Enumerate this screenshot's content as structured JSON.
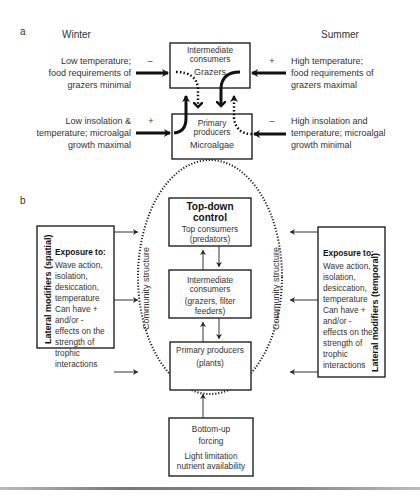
{
  "panel_a": {
    "label": "a",
    "winter": {
      "title": "Winter",
      "top_text": [
        "Low temperature;",
        "food requirements of",
        "grazers minimal"
      ],
      "top_sign": "–",
      "bottom_text": [
        "Low insolation &",
        "temperature; microalgal",
        "growth maximal"
      ],
      "bottom_sign": "+"
    },
    "summer": {
      "title": "Summer",
      "top_text": [
        "High temperature;",
        "food requirements of",
        "grazers maximal"
      ],
      "top_sign": "+",
      "bottom_text": [
        "High insolation and",
        "temperature; microalgal",
        "growth minimal"
      ],
      "bottom_sign": "–"
    },
    "intermediate_box": {
      "lines": [
        "Intermediate",
        "consumers"
      ],
      "sub": "Grazers"
    },
    "primary_box": {
      "lines": [
        "Primary",
        "producers"
      ],
      "sub": "Microalgae"
    }
  },
  "panel_b": {
    "label": "b",
    "left_panel": {
      "vertical_title": "Lateral modifiers  (spatial)",
      "heading": "Exposure to:",
      "lines": [
        "Wave action,",
        "isolation,",
        "desiccation,",
        "temperature",
        "Can have +",
        "and/or -",
        "effects on the",
        "strength of",
        "trophic",
        "interactions"
      ]
    },
    "right_panel": {
      "vertical_title": "Lateral modifiers  (temporal)",
      "heading": "Exposure to:",
      "lines": [
        "Wave action,",
        "isolation,",
        "desiccation,",
        "temperature",
        "Can have +",
        "and/or -",
        "effects on the",
        "strength of",
        "trophic",
        "interactions"
      ]
    },
    "community_label": "Community structure",
    "top_box": {
      "bold": [
        "Top-down",
        "control"
      ],
      "lines": [
        "Top consumers",
        "(predators)"
      ]
    },
    "middle_box": {
      "lines": [
        "Intermediate",
        "consumers"
      ],
      "sub": [
        "(grazers, filter",
        "feeders)"
      ]
    },
    "primary_box": {
      "lines": [
        "Primary producers",
        "(plants)"
      ]
    },
    "bottom_box": {
      "lines": [
        "Bottom-up",
        "forcing"
      ],
      "sub": [
        "Light limitation",
        "nutrient availability"
      ]
    }
  }
}
